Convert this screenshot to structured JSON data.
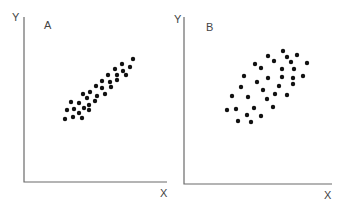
{
  "chart_data": [
    {
      "type": "scatter",
      "title": "A",
      "xlabel": "X",
      "ylabel": "Y",
      "grid": false,
      "description": "Strong positive linear correlation, tightly clustered",
      "frame": {
        "origin": [
          24,
          182
        ],
        "y_top": 17,
        "x_right": 167
      },
      "labels": {
        "panel": [
          44,
          29
        ],
        "y": [
          12,
          21
        ],
        "x": [
          160,
          197
        ]
      },
      "points": [
        [
          133,
          59
        ],
        [
          122,
          64
        ],
        [
          130,
          67
        ],
        [
          115,
          69
        ],
        [
          123,
          71
        ],
        [
          108,
          75
        ],
        [
          117,
          75
        ],
        [
          126,
          75
        ],
        [
          102,
          81
        ],
        [
          110,
          82
        ],
        [
          117,
          80
        ],
        [
          96,
          86
        ],
        [
          102,
          88
        ],
        [
          111,
          87
        ],
        [
          90,
          92
        ],
        [
          83,
          94
        ],
        [
          97,
          96
        ],
        [
          105,
          94
        ],
        [
          87,
          98
        ],
        [
          95,
          101
        ],
        [
          71,
          102
        ],
        [
          79,
          103
        ],
        [
          89,
          105
        ],
        [
          67,
          110
        ],
        [
          74,
          109
        ],
        [
          84,
          108
        ],
        [
          89,
          110
        ],
        [
          79,
          113
        ],
        [
          65,
          119
        ],
        [
          73,
          117
        ],
        [
          82,
          118
        ]
      ]
    },
    {
      "type": "scatter",
      "title": "B",
      "xlabel": "X",
      "ylabel": "Y",
      "grid": false,
      "description": "Moderate positive correlation, widely dispersed",
      "frame": {
        "origin": [
          184,
          184
        ],
        "y_top": 17,
        "x_right": 332
      },
      "labels": {
        "panel": [
          206,
          31
        ],
        "y": [
          174,
          23
        ],
        "x": [
          324,
          199
        ]
      },
      "points": [
        [
          283,
          51
        ],
        [
          297,
          55
        ],
        [
          287,
          57
        ],
        [
          268,
          56
        ],
        [
          274,
          61
        ],
        [
          291,
          62
        ],
        [
          307,
          63
        ],
        [
          255,
          64
        ],
        [
          261,
          68
        ],
        [
          282,
          69
        ],
        [
          294,
          69
        ],
        [
          244,
          76
        ],
        [
          268,
          78
        ],
        [
          282,
          77
        ],
        [
          293,
          78
        ],
        [
          303,
          76
        ],
        [
          257,
          82
        ],
        [
          293,
          84
        ],
        [
          279,
          86
        ],
        [
          241,
          87
        ],
        [
          263,
          90
        ],
        [
          275,
          94
        ],
        [
          287,
          95
        ],
        [
          232,
          96
        ],
        [
          248,
          97
        ],
        [
          267,
          99
        ],
        [
          273,
          107
        ],
        [
          227,
          110
        ],
        [
          236,
          109
        ],
        [
          254,
          108
        ],
        [
          247,
          115
        ],
        [
          261,
          116
        ],
        [
          238,
          121
        ],
        [
          251,
          122
        ]
      ]
    }
  ],
  "panels": {
    "a": {
      "label": "A",
      "x_axis": "X",
      "y_axis": "Y"
    },
    "b": {
      "label": "B",
      "x_axis": "X",
      "y_axis": "Y"
    }
  },
  "colors": {
    "dot": "#111111",
    "axis": "#6a6a6a",
    "text": "#444444"
  }
}
